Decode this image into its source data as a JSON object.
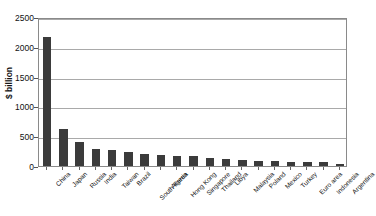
{
  "chart_data": {
    "type": "bar",
    "title": "",
    "xlabel": "",
    "ylabel": "$ billion",
    "ylim": [
      0,
      2500
    ],
    "ytick_values": [
      0,
      500,
      1000,
      1500,
      2000,
      2500
    ],
    "ytick_labels": [
      "0",
      "500",
      "1000",
      "1500",
      "2000",
      "2500"
    ],
    "grid": true,
    "legend": false,
    "bar_color": "#3b3b3b",
    "categories": [
      "China",
      "Japan",
      "Russia",
      "India",
      "Taiwan",
      "Brazil",
      "South Korea",
      "Algeria",
      "Hong Kong",
      "Singapore",
      "Thailand",
      "Libya",
      "Malaysia",
      "Poland",
      "Mexico",
      "Turkey",
      "Euro area",
      "Indonesia",
      "Argentina"
    ],
    "values": [
      2170,
      620,
      400,
      290,
      270,
      240,
      200,
      180,
      170,
      160,
      140,
      110,
      100,
      90,
      85,
      75,
      65,
      60,
      30
    ]
  },
  "axis": {
    "y_title": "$ billion"
  }
}
